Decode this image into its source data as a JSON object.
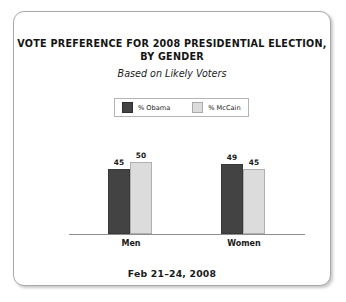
{
  "chart_data": {
    "type": "bar",
    "title": "VOTE PREFERENCE FOR 2008 PRESIDENTIAL ELECTION, BY GENDER",
    "title_line1": "VOTE PREFERENCE FOR 2008 PRESIDENTIAL ELECTION,",
    "title_line2": "BY GENDER",
    "subtitle": "Based on Likely Voters",
    "footer": "Feb 21–24, 2008",
    "categories": [
      "Men",
      "Women"
    ],
    "series": [
      {
        "name": "% Obama",
        "values": [
          45,
          49
        ],
        "color": "#434343"
      },
      {
        "name": "% McCain",
        "values": [
          50,
          45
        ],
        "color": "#dcdcdc"
      }
    ],
    "xlabel": "",
    "ylabel": "",
    "ylim": [
      0,
      60
    ],
    "grid": false,
    "legend_position": "top-center",
    "value_labels": true
  },
  "legend": {
    "entries": [
      {
        "label": "% Obama",
        "swatch": "dark-gray-swatch-icon"
      },
      {
        "label": "% McCain",
        "swatch": "light-gray-swatch-icon"
      }
    ]
  },
  "bars": {
    "men_obama": {
      "label": "45",
      "height_pct": 75.0
    },
    "men_mccain": {
      "label": "50",
      "height_pct": 83.3
    },
    "women_obama": {
      "label": "49",
      "height_pct": 81.7
    },
    "women_mccain": {
      "label": "45",
      "height_pct": 75.0
    }
  }
}
